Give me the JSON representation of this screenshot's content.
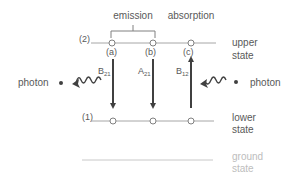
{
  "diagram": {
    "top_labels": {
      "emission": "emission",
      "absorption": "absorption"
    },
    "levels": [
      {
        "id": "upper",
        "number_label": "(2)",
        "side_label_line1": "upper",
        "side_label_line2": "state"
      },
      {
        "id": "lower",
        "number_label": "(1)",
        "side_label_line1": "lower",
        "side_label_line2": "state"
      },
      {
        "id": "ground",
        "number_label": "",
        "side_label_line1": "ground",
        "side_label_line2": "state"
      }
    ],
    "transitions": [
      {
        "tag": "(a)",
        "coef": "B",
        "coef_sub": "21",
        "direction": "down"
      },
      {
        "tag": "(b)",
        "coef": "A",
        "coef_sub": "21",
        "direction": "down"
      },
      {
        "tag": "(c)",
        "coef": "B",
        "coef_sub": "12",
        "direction": "up"
      }
    ],
    "photons": {
      "left": "photon",
      "right": "photon"
    },
    "colors": {
      "line": "#a6a6a6",
      "arrow": "#404040",
      "text": "#595959",
      "ground_text": "#bdbdbd"
    }
  }
}
